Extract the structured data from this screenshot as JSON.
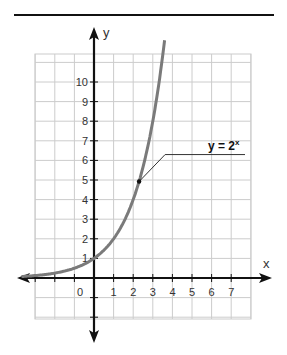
{
  "chart_data": {
    "type": "line",
    "title": "",
    "function": "y = 2^x",
    "annotation": {
      "text": "y = 2",
      "superscript": "x",
      "point": [
        2.3,
        4.92
      ]
    },
    "xlabel": "x",
    "ylabel": "y",
    "xlim": [
      -3,
      8
    ],
    "ylim": [
      -2,
      11.2
    ],
    "grid": true,
    "x_ticks": [
      "0",
      "1",
      "2",
      "3",
      "4",
      "5",
      "6",
      "7"
    ],
    "y_ticks": [
      "1",
      "2",
      "3",
      "4",
      "5",
      "6",
      "7",
      "8",
      "9",
      "10"
    ],
    "series": [
      {
        "name": "y = 2^x",
        "x": [
          -3,
          -2,
          -1,
          0,
          1,
          2,
          2.3,
          3,
          3.5
        ],
        "y": [
          0.125,
          0.25,
          0.5,
          1,
          2,
          4,
          4.92,
          8,
          11.3
        ]
      }
    ],
    "colors": {
      "curve": "#7a7a7a",
      "axis": "#111111",
      "grid": "#cccccc"
    }
  }
}
